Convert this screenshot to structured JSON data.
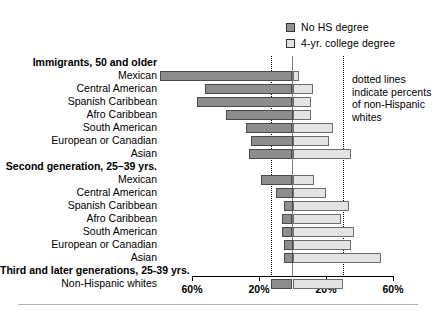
{
  "legend": {
    "items": [
      {
        "label": "No HS degree",
        "icon": "square-filled-icon",
        "color": "#8f8f8f"
      },
      {
        "label": "4-yr. college degree",
        "icon": "square-outline-icon",
        "color": "#e2e2e2"
      }
    ]
  },
  "annotation": {
    "line1": "dotted lines",
    "line2": "indicate percents",
    "line3": "of non-Hispanic",
    "line4": "whites"
  },
  "axis": {
    "tick_labels": [
      "60%",
      "20%",
      "20%",
      "60%"
    ],
    "left_label_far": "60%",
    "center_value": "0%"
  },
  "chart_data": {
    "type": "bar",
    "title": "",
    "subtitle": "",
    "xlabel": "",
    "ylabel": "",
    "orientation": "horizontal",
    "style": "back-to-back diverging (tornado)",
    "grid": false,
    "legend_position": "top-right",
    "xlim": [
      -70,
      70
    ],
    "xticks": [
      -60,
      -20,
      20,
      60
    ],
    "xtick_labels": [
      "60%",
      "20%",
      "20%",
      "60%"
    ],
    "reference_lines": {
      "type": "dotted",
      "description": "dotted lines indicate percents of non-Hispanic whites",
      "no_hs_degree": 13,
      "college_degree": 30
    },
    "series": [
      {
        "name": "No HS degree",
        "direction": "left",
        "color": "#8d8d8d"
      },
      {
        "name": "4-yr. college degree",
        "direction": "right",
        "color": "#e3e3e3"
      }
    ],
    "groups": [
      {
        "label": "Immigrants, 50 and older",
        "rows": [
          {
            "category": "Mexican",
            "no_hs_degree": 79,
            "college_degree": 4
          },
          {
            "category": "Central American",
            "no_hs_degree": 52,
            "college_degree": 12
          },
          {
            "category": "Spanish Caribbean",
            "no_hs_degree": 57,
            "college_degree": 11
          },
          {
            "category": "Afro Caribbean",
            "no_hs_degree": 40,
            "college_degree": 11
          },
          {
            "category": "South American",
            "no_hs_degree": 28,
            "college_degree": 24
          },
          {
            "category": "European or Canadian",
            "no_hs_degree": 25,
            "college_degree": 22
          },
          {
            "category": "Asian",
            "no_hs_degree": 26,
            "college_degree": 35
          }
        ]
      },
      {
        "label": "Second generation, 25–39 yrs.",
        "rows": [
          {
            "category": "Mexican",
            "no_hs_degree": 19,
            "college_degree": 13
          },
          {
            "category": "Central American",
            "no_hs_degree": 10,
            "college_degree": 20
          },
          {
            "category": "Spanish Caribbean",
            "no_hs_degree": 5,
            "college_degree": 34
          },
          {
            "category": "Afro Caribbean",
            "no_hs_degree": 6,
            "college_degree": 29
          },
          {
            "category": "South American",
            "no_hs_degree": 6,
            "college_degree": 37
          },
          {
            "category": "European or Canadian",
            "no_hs_degree": 5,
            "college_degree": 35
          },
          {
            "category": "Asian",
            "no_hs_degree": 5,
            "college_degree": 53
          }
        ]
      },
      {
        "label": "Third and later generations, 25-39 yrs.",
        "rows": [
          {
            "category": "Non-Hispanic whites",
            "no_hs_degree": 13,
            "college_degree": 30
          }
        ]
      }
    ]
  }
}
